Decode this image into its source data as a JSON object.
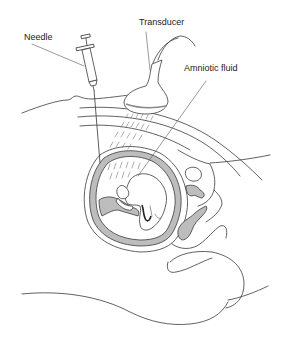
{
  "figure": {
    "labels": {
      "needle": "Needle",
      "transducer": "Transducer",
      "amniotic_fluid": "Amniotic fluid"
    },
    "colors": {
      "line": "#3a3a3a",
      "fill_gray": "#bdbdbd",
      "background": "#ffffff",
      "text": "#222222"
    }
  }
}
